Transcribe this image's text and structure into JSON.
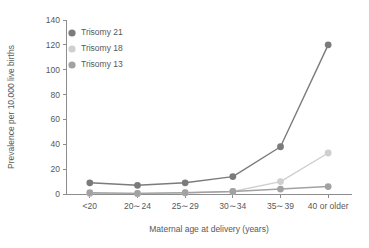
{
  "chart_data": {
    "type": "line",
    "title": "",
    "xlabel": "Maternal age at delivery (years)",
    "ylabel": "Prevalence per 10,000 live births",
    "categories": [
      "<20",
      "20∼24",
      "25∼29",
      "30∼34",
      "35∼39",
      "40 or older"
    ],
    "ylim": [
      0,
      140
    ],
    "yticks": [
      0,
      20,
      40,
      60,
      80,
      100,
      120,
      140
    ],
    "ytick_labels": [
      "0",
      "20",
      "40",
      "60",
      "80",
      "100",
      "120",
      "140"
    ],
    "grid": false,
    "legend_position": "top-left-inside",
    "series": [
      {
        "name": "Trisomy 21",
        "color": "#7b7b7b",
        "values": [
          9,
          7,
          9,
          14,
          38,
          120
        ]
      },
      {
        "name": "Trisomy 18",
        "color": "#cfcfcf",
        "values": [
          0.5,
          0.5,
          1,
          2,
          10,
          33
        ]
      },
      {
        "name": "Trisomy 13",
        "color": "#a2a2a2",
        "values": [
          1,
          0.5,
          1,
          2,
          4,
          6
        ]
      }
    ]
  },
  "colors": {
    "axis": "#8d8d8d",
    "text": "#585858",
    "background": "#ffffff"
  }
}
